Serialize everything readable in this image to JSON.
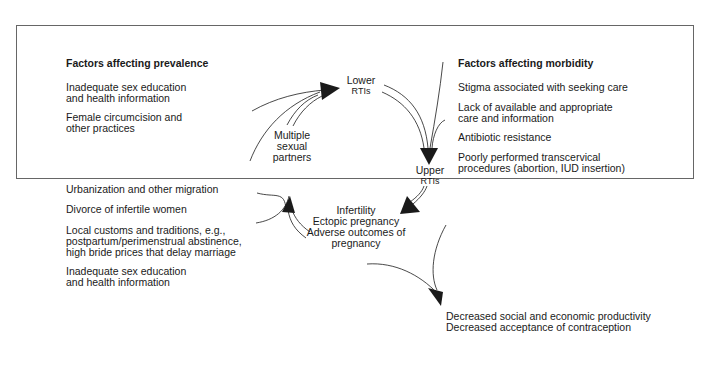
{
  "diagram": {
    "left_panel": {
      "heading": "Factors affecting prevalence",
      "items_top": [
        {
          "line1": "Inadequate sex education",
          "line2": "and health information"
        },
        {
          "line1": "Female circumcision and",
          "line2": "other practices"
        }
      ],
      "items_bottom": [
        {
          "line1": "Urbanization and other migration"
        },
        {
          "line1": "Divorce of infertile women"
        },
        {
          "line1": "Local customs and traditions, e.g.,",
          "line2": "postpartum/perimenstrual abstinence,",
          "line3": "high bride prices that delay marriage"
        },
        {
          "line1": "Inadequate sex education",
          "line2": "and health information"
        }
      ]
    },
    "right_panel": {
      "heading": "Factors affecting morbidity",
      "items": [
        {
          "line1": "Stigma associated with seeking care"
        },
        {
          "line1": "Lack of available and appropriate",
          "line2": "care and information"
        },
        {
          "line1": "Antibiotic resistance"
        },
        {
          "line1": "Poorly performed transcervical",
          "line2": "procedures (abortion, IUD insertion)"
        }
      ]
    },
    "cycle_nodes": {
      "lower_rtis": {
        "line1": "Lower",
        "line2": "RTIs"
      },
      "upper_rtis": {
        "line1": "Upper",
        "line2": "RTIs"
      },
      "multiple_partners": {
        "line1": "Multiple",
        "line2": "sexual",
        "line3": "partners"
      },
      "outcomes": {
        "line1": "Infertility",
        "line2": "Ectopic pregnancy",
        "line3": "Adverse outcomes of",
        "line4": "pregnancy"
      }
    },
    "consequences": {
      "line1": "Decreased social and economic productivity",
      "line2": "Decreased acceptance of contraception"
    },
    "colors": {
      "line": "#1a1a1a",
      "border": "#666666",
      "background": "#ffffff"
    }
  }
}
